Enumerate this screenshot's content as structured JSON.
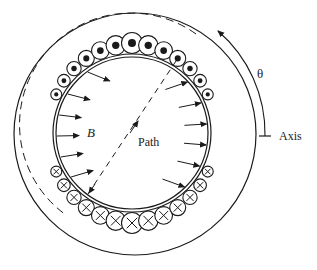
{
  "diagram": {
    "labels": {
      "field": "B",
      "path": "Path",
      "angle": "θ",
      "axis": "Axis"
    },
    "colors": {
      "stroke": "#1a1a1a",
      "background": "#ffffff"
    },
    "geometry": {
      "outer_circle": {
        "cx": 135,
        "cy": 134,
        "r": 121
      },
      "inner_circle": {
        "cx": 132,
        "cy": 133,
        "r_outer": 79,
        "r_inner": 76
      },
      "dashed_arc_radius": 100
    },
    "conductors_out": "dot-circles along top (current out of page)",
    "conductors_in": "x-circles along bottom (current into page)"
  }
}
